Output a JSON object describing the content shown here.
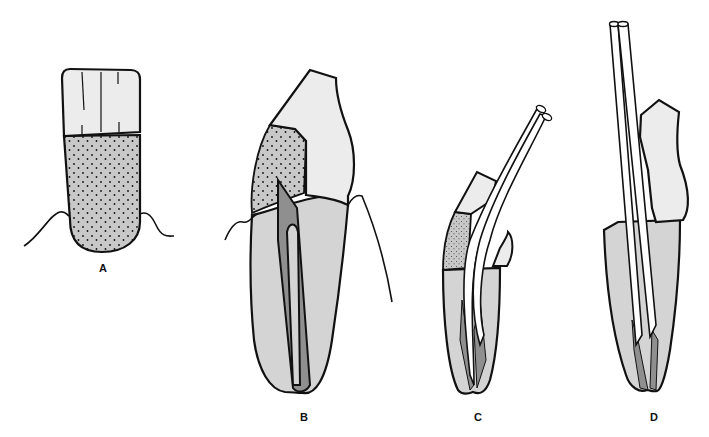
{
  "figure": {
    "colors": {
      "outline": "#111111",
      "crown_enamel": "#ececec",
      "root_dentin": "#d4d4d4",
      "stippled_restoration": "#c8c8c8",
      "pulp_canal": "#8f8f8f",
      "post": "#ffffff",
      "background": "#ffffff"
    },
    "panels": [
      {
        "id": "A",
        "label": "A",
        "content": "Front view of tooth with rectangular crown (three vertical grooves) above stippled gray root, gum line at neck"
      },
      {
        "id": "B",
        "label": "B",
        "content": "Side section of tooth: light crown, stippled restoration, dark pulp canal inside root, gum line"
      },
      {
        "id": "C",
        "label": "C",
        "content": "Split tooth with two curved posts inserted into canals"
      },
      {
        "id": "D",
        "label": "D",
        "content": "Tooth with long straight double post extending above crown into root canal"
      }
    ]
  }
}
